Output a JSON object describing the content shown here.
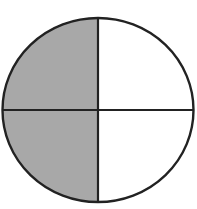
{
  "diagram": {
    "type": "fraction-circle",
    "total_parts": 4,
    "shaded_parts": 2,
    "shaded_fraction": "2/4",
    "parts": [
      {
        "name": "top-left",
        "shaded": true
      },
      {
        "name": "top-right",
        "shaded": false
      },
      {
        "name": "bottom-left",
        "shaded": true
      },
      {
        "name": "bottom-right",
        "shaded": false
      }
    ],
    "colors": {
      "shaded": "#a8a8a8",
      "unshaded": "#ffffff",
      "stroke": "#222222",
      "background": "#ffffff"
    }
  }
}
